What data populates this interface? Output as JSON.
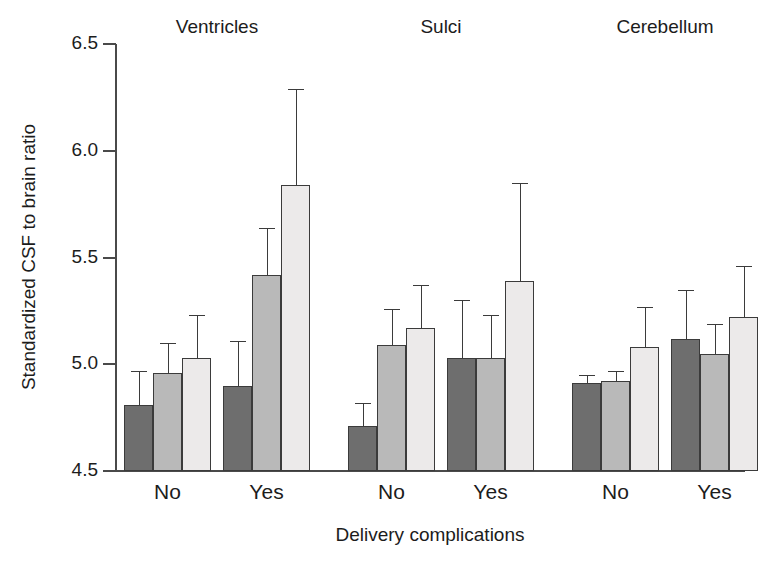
{
  "chart_data": {
    "type": "bar",
    "title": "",
    "xlabel": "Delivery complications",
    "ylabel": "Standardized CSF to brain ratio",
    "ylim": [
      4.5,
      6.5
    ],
    "yticks": [
      "4.5",
      "5.0",
      "5.5",
      "6.0",
      "6.5"
    ],
    "ytick_values": [
      4.5,
      5.0,
      5.5,
      6.0,
      6.5
    ],
    "grid": false,
    "legend": "none",
    "error_bars": "upper-only",
    "panel_titles": [
      "Ventricles",
      "Sulci",
      "Cerebellum"
    ],
    "categories": [
      "No",
      "Yes",
      "No",
      "Yes",
      "No",
      "Yes"
    ],
    "series": [
      {
        "name": "series-1-dark",
        "color": "#6e6e6e",
        "values": [
          4.81,
          4.9,
          4.71,
          5.03,
          4.91,
          5.12
        ],
        "errors": [
          0.16,
          0.21,
          0.11,
          0.27,
          0.04,
          0.23
        ]
      },
      {
        "name": "series-2-medium",
        "color": "#b9b9b9",
        "values": [
          4.96,
          5.42,
          5.09,
          5.03,
          4.92,
          5.05
        ],
        "errors": [
          0.14,
          0.22,
          0.17,
          0.2,
          0.05,
          0.14
        ]
      },
      {
        "name": "series-3-light",
        "color": "#eceaea",
        "values": [
          5.03,
          5.84,
          5.17,
          5.39,
          5.08,
          5.22
        ],
        "errors": [
          0.2,
          0.45,
          0.2,
          0.46,
          0.19,
          0.24
        ]
      }
    ],
    "groups": [
      {
        "panel": "Ventricles",
        "category": "No",
        "bars": [
          {
            "series": "series-1-dark",
            "value": 4.81,
            "error_upper": 0.16
          },
          {
            "series": "series-2-medium",
            "value": 4.96,
            "error_upper": 0.14
          },
          {
            "series": "series-3-light",
            "value": 5.03,
            "error_upper": 0.2
          }
        ]
      },
      {
        "panel": "Ventricles",
        "category": "Yes",
        "bars": [
          {
            "series": "series-1-dark",
            "value": 4.9,
            "error_upper": 0.21
          },
          {
            "series": "series-2-medium",
            "value": 5.42,
            "error_upper": 0.22
          },
          {
            "series": "series-3-light",
            "value": 5.84,
            "error_upper": 0.45
          }
        ]
      },
      {
        "panel": "Sulci",
        "category": "No",
        "bars": [
          {
            "series": "series-1-dark",
            "value": 4.71,
            "error_upper": 0.11
          },
          {
            "series": "series-2-medium",
            "value": 5.09,
            "error_upper": 0.17
          },
          {
            "series": "series-3-light",
            "value": 5.17,
            "error_upper": 0.2
          }
        ]
      },
      {
        "panel": "Sulci",
        "category": "Yes",
        "bars": [
          {
            "series": "series-1-dark",
            "value": 5.03,
            "error_upper": 0.27
          },
          {
            "series": "series-2-medium",
            "value": 5.03,
            "error_upper": 0.2
          },
          {
            "series": "series-3-light",
            "value": 5.39,
            "error_upper": 0.46
          }
        ]
      },
      {
        "panel": "Cerebellum",
        "category": "No",
        "bars": [
          {
            "series": "series-1-dark",
            "value": 4.91,
            "error_upper": 0.04
          },
          {
            "series": "series-2-medium",
            "value": 4.92,
            "error_upper": 0.05
          },
          {
            "series": "series-3-light",
            "value": 5.08,
            "error_upper": 0.19
          }
        ]
      },
      {
        "panel": "Cerebellum",
        "category": "Yes",
        "bars": [
          {
            "series": "series-1-dark",
            "value": 5.12,
            "error_upper": 0.23
          },
          {
            "series": "series-2-medium",
            "value": 5.05,
            "error_upper": 0.14
          },
          {
            "series": "series-3-light",
            "value": 5.22,
            "error_upper": 0.24
          }
        ]
      }
    ]
  },
  "layout": {
    "plot_left": 115,
    "plot_top": 44,
    "plot_width": 630,
    "plot_height": 427,
    "bar_width": 29,
    "group_gap": 12,
    "panel_gap": 26,
    "first_bar_x": 9,
    "axis_color": "#4a4a4a",
    "bar_edge_color": "#3b3b3b",
    "text_color": "#1c1c1c"
  }
}
